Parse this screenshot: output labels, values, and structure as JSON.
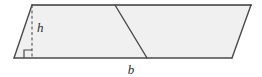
{
  "figure": {
    "name": "parallelogram-area-diagram",
    "type": "geometry-diagram",
    "shape": "parallelogram",
    "caption": "",
    "labels": {
      "height": "h",
      "base": "b"
    },
    "colors": {
      "fill": "#f0f0f0",
      "stroke": "#4a4a4a",
      "top_stroke": "#3a3a3a",
      "dashed_stroke": "#555555",
      "text": "#2b2b2b",
      "background": "#ffffff"
    },
    "geometry": {
      "top_left": [
        32,
        5
      ],
      "top_right": [
        251,
        5
      ],
      "bottom_right": [
        232,
        58
      ],
      "bottom_left": [
        14,
        58
      ],
      "height_line": {
        "from": [
          32,
          5
        ],
        "to": [
          32,
          58
        ],
        "style": "dashed"
      },
      "interior_diagonal": {
        "from": [
          115,
          5
        ],
        "to": [
          147,
          58
        ],
        "style": "solid"
      },
      "right_angle_marker": {
        "corner": [
          32,
          58
        ],
        "size": 8
      },
      "label_positions": {
        "height": [
          37,
          32
        ],
        "base": [
          131,
          74
        ]
      }
    }
  }
}
